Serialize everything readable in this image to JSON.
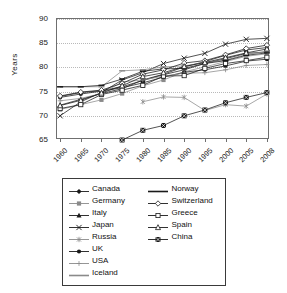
{
  "chart_data": {
    "type": "line",
    "title": "",
    "xlabel": "",
    "ylabel": "Years",
    "x": [
      1960,
      1965,
      1970,
      1975,
      1980,
      1985,
      1990,
      1995,
      2000,
      2005,
      2008
    ],
    "xticklabels": [
      "1960",
      "1965",
      "1970",
      "1975",
      "1980",
      "1985",
      "1990",
      "1995",
      "2000",
      "2005",
      "2008"
    ],
    "yticklabels": [
      "65",
      "70",
      "75",
      "80",
      "85",
      "90"
    ],
    "yticks": [
      65,
      70,
      75,
      80,
      85,
      90
    ],
    "ylim": [
      65,
      90
    ],
    "grid": "horizontal-dotted",
    "legend_position": "below-chart",
    "legend_columns": 2,
    "series": [
      {
        "name": "Canada",
        "marker": "filled-diamond",
        "color": "#1a1a1a",
        "values": [
          74.0,
          74.8,
          75.2,
          76.0,
          77.3,
          78.5,
          79.5,
          80.8,
          81.8,
          82.9,
          83.2
        ]
      },
      {
        "name": "Germany",
        "marker": "filled-square",
        "color": "#8a8a8a",
        "values": [
          71.3,
          72.3,
          73.3,
          74.6,
          76.2,
          77.4,
          79.1,
          80.1,
          81.2,
          82.3,
          82.8
        ]
      },
      {
        "name": "Italy",
        "marker": "filled-triangle",
        "color": "#1a1a1a",
        "values": [
          72.2,
          73.4,
          74.6,
          75.6,
          77.4,
          78.6,
          80.1,
          81.2,
          82.5,
          83.6,
          84.1
        ]
      },
      {
        "name": "Japan",
        "marker": "cross-x",
        "color": "#1a1a1a",
        "values": [
          70.0,
          72.9,
          74.8,
          77.4,
          78.9,
          80.8,
          81.9,
          82.9,
          84.8,
          85.8,
          86.0
        ]
      },
      {
        "name": "Russia",
        "marker": "asterisk",
        "color": "#8a8a8a",
        "values": [
          null,
          null,
          null,
          null,
          72.9,
          73.9,
          73.8,
          71.1,
          72.3,
          72.0,
          74.5
        ]
      },
      {
        "name": "UK",
        "marker": "filled-circle",
        "color": "#1a1a1a",
        "values": [
          73.8,
          74.5,
          75.1,
          75.8,
          76.8,
          78.0,
          79.0,
          79.5,
          80.3,
          81.3,
          81.7
        ]
      },
      {
        "name": "USA",
        "marker": "plus",
        "color": "#8a8a8a",
        "values": [
          73.1,
          73.6,
          74.6,
          77.0,
          77.4,
          78.2,
          78.8,
          78.9,
          79.5,
          80.4,
          80.6
        ]
      },
      {
        "name": "Iceland",
        "marker": "dash-line",
        "color": "#8a8a8a",
        "values": [
          76.0,
          76.0,
          76.0,
          79.3,
          79.5,
          80.1,
          80.3,
          81.0,
          81.5,
          82.7,
          83.3
        ]
      },
      {
        "name": "Norway",
        "marker": "plain-line",
        "color": "#1a1a1a",
        "values": [
          76.0,
          76.0,
          76.3,
          77.6,
          79.2,
          79.7,
          79.8,
          80.8,
          81.4,
          82.5,
          83.0
        ]
      },
      {
        "name": "Switzerland",
        "marker": "open-diamond",
        "color": "#1a1a1a",
        "values": [
          74.1,
          74.9,
          75.3,
          76.7,
          78.6,
          79.5,
          80.9,
          81.4,
          82.6,
          83.9,
          84.6
        ]
      },
      {
        "name": "Greece",
        "marker": "open-square",
        "color": "#1a1a1a",
        "values": [
          71.5,
          72.3,
          74.4,
          75.3,
          76.3,
          78.2,
          78.3,
          79.8,
          80.8,
          81.4,
          82.1
        ]
      },
      {
        "name": "Spain",
        "marker": "open-triangle",
        "color": "#1a1a1a",
        "values": [
          72.1,
          73.2,
          74.7,
          76.2,
          78.1,
          78.9,
          80.2,
          81.0,
          82.0,
          83.0,
          83.8
        ]
      },
      {
        "name": "China",
        "marker": "crossed-square",
        "color": "#1a1a1a",
        "values": [
          null,
          null,
          null,
          65.0,
          67.0,
          68.0,
          70.0,
          71.2,
          72.7,
          73.8,
          74.8
        ]
      }
    ]
  },
  "legend": {
    "left_column": [
      {
        "label": "Canada",
        "marker": "filled-diamond"
      },
      {
        "label": "Germany",
        "marker": "filled-square"
      },
      {
        "label": "Italy",
        "marker": "filled-triangle"
      },
      {
        "label": "Japan",
        "marker": "cross-x"
      },
      {
        "label": "Russia",
        "marker": "asterisk"
      },
      {
        "label": "UK",
        "marker": "filled-circle"
      },
      {
        "label": "USA",
        "marker": "plus"
      },
      {
        "label": "Iceland",
        "marker": "dash-line"
      }
    ],
    "right_column": [
      {
        "label": "Norway",
        "marker": "plain-line"
      },
      {
        "label": "Switzerland",
        "marker": "open-diamond"
      },
      {
        "label": "Greece",
        "marker": "open-square"
      },
      {
        "label": "Spain",
        "marker": "open-triangle"
      },
      {
        "label": "China",
        "marker": "crossed-square"
      }
    ]
  },
  "colors": {
    "dark": "#1a1a1a",
    "gray": "#8a8a8a",
    "grid": "#b9b9b9",
    "axis": "#6f6f6f",
    "background": "#ffffff"
  }
}
